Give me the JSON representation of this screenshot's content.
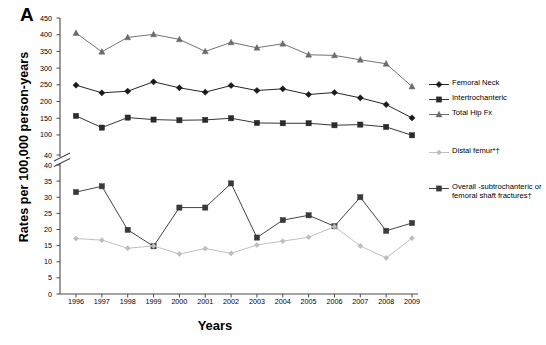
{
  "panel": {
    "letter": "A"
  },
  "axes": {
    "ylabel": "Rates per 100,000 person-years",
    "xlabel": "Years",
    "y_upper_ticks": [
      "450",
      "400",
      "350",
      "300",
      "250",
      "200",
      "150",
      "100",
      "40"
    ],
    "y_lower_ticks": [
      "40",
      "35",
      "30",
      "25",
      "20",
      "15",
      "10",
      "5",
      "0"
    ],
    "x_ticks": [
      "1996",
      "1997",
      "1998",
      "1999",
      "2000",
      "2001",
      "2002",
      "2003",
      "2004",
      "2005",
      "2006",
      "2007",
      "2008",
      "2009"
    ]
  },
  "legend": {
    "items": [
      {
        "label": "Femoral Neck",
        "marker": "diamond",
        "color": "#1a1a1a"
      },
      {
        "label": "Intertrochanteric",
        "marker": "square",
        "color": "#2b2b2b"
      },
      {
        "label": "Total Hip Fx",
        "marker": "triangle",
        "color": "#6b6b6b"
      },
      {
        "label": "Distal femur*†",
        "marker": "diamond-small",
        "color": "#bdbdbd"
      },
      {
        "label": "Overall -subtrochanteric or femoral shaft fractures†",
        "marker": "square",
        "color": "#3a3a3a"
      }
    ]
  },
  "chart_data": {
    "type": "line",
    "title": "",
    "xlabel": "Years",
    "ylabel": "Rates per 100,000 person-years",
    "broken_axis": true,
    "axis_upper": {
      "min": 40,
      "max": 450,
      "ticks": [
        40,
        100,
        150,
        200,
        250,
        300,
        350,
        400,
        450
      ]
    },
    "axis_lower": {
      "min": 0,
      "max": 40,
      "ticks": [
        0,
        5,
        10,
        15,
        20,
        25,
        30,
        35,
        40
      ]
    },
    "grid": false,
    "legend_position": "right",
    "x": [
      1996,
      1997,
      1998,
      1999,
      2000,
      2001,
      2002,
      2003,
      2004,
      2005,
      2006,
      2007,
      2008,
      2009
    ],
    "series": [
      {
        "name": "Total Hip Fx",
        "axis": "upper",
        "marker": "triangle",
        "color": "#6b6b6b",
        "values": [
          405,
          349,
          392,
          401,
          386,
          350,
          377,
          361,
          373,
          340,
          338,
          325,
          313,
          245
        ]
      },
      {
        "name": "Femoral Neck",
        "axis": "upper",
        "marker": "diamond",
        "color": "#1a1a1a",
        "values": [
          249,
          226,
          231,
          259,
          241,
          228,
          248,
          233,
          238,
          221,
          227,
          211,
          191,
          151
        ]
      },
      {
        "name": "Intertrochanteric",
        "axis": "upper",
        "marker": "square",
        "color": "#2b2b2b",
        "values": [
          157,
          122,
          152,
          146,
          144,
          145,
          150,
          136,
          135,
          135,
          129,
          131,
          124,
          99
        ]
      },
      {
        "name": "Overall -subtrochanteric or femoral shaft fractures†",
        "axis": "lower",
        "marker": "square",
        "color": "#3a3a3a",
        "values": [
          31.6,
          33.4,
          19.9,
          14.8,
          26.8,
          26.8,
          34.3,
          17.5,
          22.9,
          24.4,
          21.0,
          30.0,
          19.6,
          22.0
        ]
      },
      {
        "name": "Distal femur*†",
        "axis": "lower",
        "marker": "diamond-small",
        "color": "#bdbdbd",
        "values": [
          17.2,
          16.7,
          14.2,
          14.9,
          12.4,
          14.1,
          12.6,
          15.2,
          16.4,
          17.6,
          20.9,
          14.9,
          11.2,
          17.3
        ]
      }
    ]
  }
}
